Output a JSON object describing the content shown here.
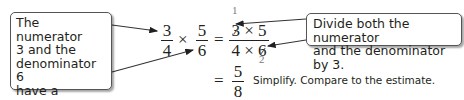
{
  "callouts": {
    "left": {
      "lines": [
        "The numerator",
        "3 and the",
        "denominator 6",
        "have a common",
        "factor, 3."
      ]
    },
    "right": {
      "lines": [
        "Divide both the numerator",
        "and the denominator by 3."
      ]
    }
  },
  "equation": {
    "frac1": {
      "num": "3",
      "den": "4"
    },
    "times": "×",
    "frac2": {
      "num": "5",
      "den": "6"
    },
    "equals": "=",
    "product": {
      "num": "3 × 5",
      "num_parts": [
        "3",
        "×",
        "5"
      ],
      "den": "4 × 6",
      "den_parts": [
        "4",
        "×",
        "6"
      ]
    },
    "cancel_above": "1",
    "cancel_below": "2",
    "result_equals": "=",
    "result": {
      "num": "5",
      "den": "8"
    },
    "note": "Simplify. Compare to the estimate."
  },
  "colors": {
    "text": "#231f20",
    "border": "#555555",
    "cancel_digits": "#7a7a7a"
  }
}
